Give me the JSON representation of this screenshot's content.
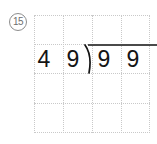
{
  "worksheet": {
    "problem_number": "15",
    "problem_number_display": "⑮",
    "problem_type": "long-division"
  },
  "division": {
    "divisor": "49",
    "dividend": "99",
    "divisor_digits": [
      "4",
      "9"
    ],
    "dividend_digits": [
      "9",
      "9"
    ],
    "quotient_digits": [
      "",
      ""
    ],
    "expression": "49)99",
    "bracket_glyph": ")"
  },
  "grid": {
    "columns": 4,
    "rows": 4,
    "line_style": "dotted",
    "line_color": "#c9c9c9"
  },
  "colors": {
    "ink": "#141414",
    "rule": "#4a4a4a",
    "grid": "#c9c9c9",
    "number_circle": "#8d8d8d",
    "background": "#ffffff"
  }
}
